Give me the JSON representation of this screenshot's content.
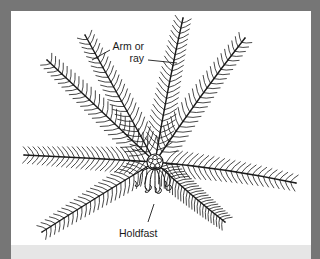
{
  "figure": {
    "labels": {
      "arm_line1": "Arm or",
      "arm_line2": "ray",
      "holdfast": "Holdfast"
    }
  },
  "colors": {
    "frame": "#767676",
    "panel": "#ffffff",
    "caption_strip": "#e6e6e6",
    "ink": "#1a1a1a"
  },
  "center": [
    155,
    162
  ],
  "arms": [
    {
      "name": "upper-left-outer",
      "tip": [
        47,
        60
      ],
      "ctrl": [
        95,
        105
      ]
    },
    {
      "name": "upper-left-inner",
      "tip": [
        85,
        35
      ],
      "ctrl": [
        118,
        95
      ]
    },
    {
      "name": "upper-right-inner",
      "tip": [
        183,
        18
      ],
      "ctrl": [
        168,
        85
      ]
    },
    {
      "name": "upper-right-outer",
      "tip": [
        245,
        38
      ],
      "ctrl": [
        200,
        95
      ]
    },
    {
      "name": "left",
      "tip": [
        24,
        155
      ],
      "ctrl": [
        90,
        158
      ]
    },
    {
      "name": "lower-left",
      "tip": [
        42,
        232
      ],
      "ctrl": [
        100,
        195
      ]
    },
    {
      "name": "right",
      "tip": [
        296,
        183
      ],
      "ctrl": [
        225,
        168
      ]
    },
    {
      "name": "lower-right",
      "tip": [
        225,
        222
      ],
      "ctrl": [
        190,
        195
      ]
    }
  ],
  "leaders": [
    {
      "name": "arm-leader-left",
      "from": [
        110,
        50
      ],
      "to": [
        92,
        60
      ]
    },
    {
      "name": "arm-leader-right",
      "from": [
        148,
        60
      ],
      "to": [
        177,
        63
      ]
    },
    {
      "name": "holdfast-leader",
      "from": [
        154,
        204
      ],
      "to": [
        148,
        222
      ]
    }
  ],
  "cirri": [
    [
      140,
      172
    ],
    [
      145,
      176
    ],
    [
      150,
      178
    ],
    [
      155,
      179
    ],
    [
      160,
      178
    ],
    [
      165,
      176
    ],
    [
      170,
      172
    ]
  ]
}
